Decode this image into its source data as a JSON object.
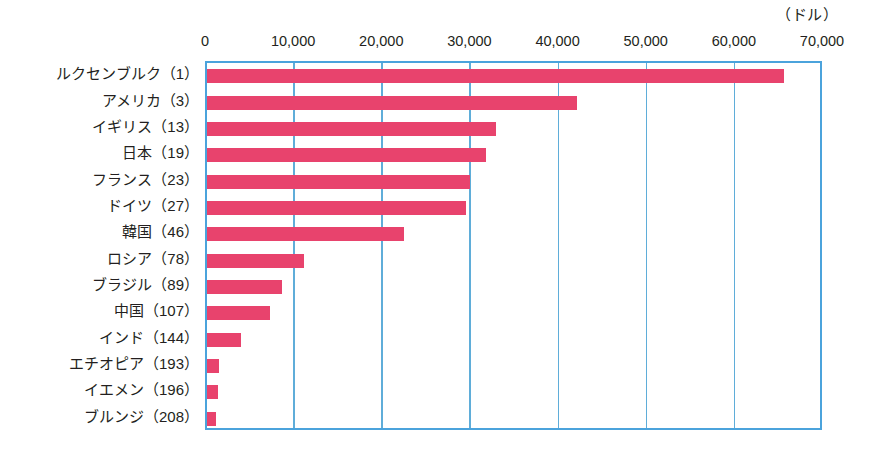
{
  "chart_data": {
    "type": "bar",
    "orientation": "horizontal",
    "title": "",
    "subtitle": "",
    "unit_caption": "（ドル）",
    "xlabel": "",
    "ylabel": "",
    "xlim": [
      0,
      70000
    ],
    "grid": true,
    "legend": "none",
    "x_ticks": [
      0,
      10000,
      20000,
      30000,
      40000,
      50000,
      60000,
      70000
    ],
    "x_tick_labels": [
      "0",
      "10,000",
      "20,000",
      "30,000",
      "40,000",
      "50,000",
      "60,000",
      "70,000"
    ],
    "categories": [
      "ルクセンブルク（1）",
      "アメリカ（3）",
      "イギリス（13）",
      "日本（19）",
      "フランス（23）",
      "ドイツ（27）",
      "韓国（46）",
      "ロシア（78）",
      "ブラジル（89）",
      "中国（107）",
      "インド（144）",
      "エチオピア（193）",
      "イエメン（196）",
      "ブルンジ（208）"
    ],
    "values": [
      65500,
      42000,
      32800,
      31700,
      29800,
      29400,
      22400,
      11000,
      8500,
      7100,
      3900,
      1400,
      1300,
      1000
    ],
    "colors": {
      "bar": "#e8436d",
      "frame": "#4ba3dc",
      "gridline": "#5fadd9",
      "text": "#231f20",
      "background": "#ffffff"
    }
  }
}
